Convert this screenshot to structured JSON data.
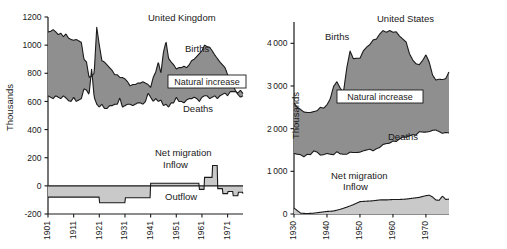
{
  "figure": {
    "background": "#ffffff",
    "ink": "#1a1a1a",
    "fill_dark": "#8f8f8f",
    "fill_light": "#c9c9c9"
  },
  "chart_data": [
    {
      "type": "area",
      "id": "united-kingdom",
      "title": "United Kingdom",
      "xlabel": "",
      "ylabel": "Thousands",
      "grid": false,
      "legend_position": "inline-annotations",
      "xlim": [
        1901,
        1977
      ],
      "ylim": [
        -200,
        1200
      ],
      "yticks": [
        -200,
        0,
        200,
        400,
        600,
        800,
        1000,
        1200
      ],
      "xticks": [
        1901,
        1911,
        1921,
        1931,
        1941,
        1951,
        1961,
        1971
      ],
      "annotations": [
        {
          "text": "United Kingdom",
          "kind": "panel-title"
        },
        {
          "text": "Births",
          "kind": "series"
        },
        {
          "text": "Deaths",
          "kind": "series"
        },
        {
          "text": "Natural increase",
          "kind": "boxed-band"
        },
        {
          "text": "Net migration",
          "kind": "series"
        },
        {
          "text": "Inflow",
          "kind": "series"
        },
        {
          "text": "Outflow",
          "kind": "series"
        }
      ],
      "series": [
        {
          "name": "Births",
          "x": [
            1901,
            1902,
            1903,
            1904,
            1905,
            1906,
            1907,
            1908,
            1909,
            1910,
            1911,
            1912,
            1913,
            1914,
            1915,
            1916,
            1917,
            1918,
            1919,
            1920,
            1921,
            1922,
            1923,
            1924,
            1925,
            1926,
            1927,
            1928,
            1929,
            1930,
            1931,
            1932,
            1933,
            1934,
            1935,
            1936,
            1937,
            1938,
            1939,
            1940,
            1941,
            1942,
            1943,
            1944,
            1945,
            1946,
            1947,
            1948,
            1949,
            1950,
            1951,
            1952,
            1953,
            1954,
            1955,
            1956,
            1957,
            1958,
            1959,
            1960,
            1961,
            1962,
            1963,
            1964,
            1965,
            1966,
            1967,
            1968,
            1969,
            1970,
            1971,
            1972,
            1973,
            1974,
            1975,
            1976,
            1977
          ],
          "values": [
            1093,
            1098,
            1110,
            1095,
            1075,
            1085,
            1060,
            1080,
            1050,
            1040,
            1035,
            1040,
            1030,
            1020,
            900,
            880,
            770,
            780,
            800,
            1127,
            1000,
            890,
            880,
            860,
            840,
            820,
            790,
            790,
            770,
            770,
            760,
            740,
            710,
            720,
            720,
            730,
            730,
            740,
            730,
            720,
            700,
            770,
            810,
            880,
            800,
            950,
            1025,
            905,
            880,
            860,
            830,
            840,
            840,
            850,
            840,
            860,
            890,
            900,
            920,
            940,
            960,
            1000,
            990,
            985,
            960,
            930,
            905,
            880,
            860,
            840,
            790,
            760,
            720,
            680,
            650,
            630,
            640
          ]
        },
        {
          "name": "Deaths",
          "x": [
            1901,
            1902,
            1903,
            1904,
            1905,
            1906,
            1907,
            1908,
            1909,
            1910,
            1911,
            1912,
            1913,
            1914,
            1915,
            1916,
            1917,
            1918,
            1919,
            1920,
            1921,
            1922,
            1923,
            1924,
            1925,
            1926,
            1927,
            1928,
            1929,
            1930,
            1931,
            1932,
            1933,
            1934,
            1935,
            1936,
            1937,
            1938,
            1939,
            1940,
            1941,
            1942,
            1943,
            1944,
            1945,
            1946,
            1947,
            1948,
            1949,
            1950,
            1951,
            1952,
            1953,
            1954,
            1955,
            1956,
            1957,
            1958,
            1959,
            1960,
            1961,
            1962,
            1963,
            1964,
            1965,
            1966,
            1967,
            1968,
            1969,
            1970,
            1971,
            1972,
            1973,
            1974,
            1975,
            1976,
            1977
          ],
          "values": [
            640,
            630,
            620,
            640,
            630,
            620,
            640,
            625,
            605,
            600,
            630,
            600,
            610,
            620,
            690,
            680,
            650,
            830,
            630,
            580,
            560,
            580,
            550,
            550,
            570,
            570,
            580,
            580,
            625,
            560,
            570,
            580,
            580,
            570,
            580,
            590,
            590,
            580,
            600,
            660,
            630,
            600,
            620,
            600,
            610,
            570,
            580,
            560,
            590,
            590,
            630,
            600,
            600,
            590,
            610,
            620,
            620,
            630,
            620,
            600,
            630,
            640,
            640,
            620,
            630,
            640,
            620,
            640,
            650,
            660,
            640,
            670,
            670,
            670,
            660,
            680,
            655
          ]
        },
        {
          "name": "Net migration",
          "x": [
            1901,
            1911,
            1921,
            1925,
            1931,
            1936,
            1941,
            1946,
            1951,
            1956,
            1960,
            1961,
            1962,
            1963,
            1965,
            1967,
            1969,
            1971,
            1973,
            1975,
            1977
          ],
          "values": [
            -80,
            -80,
            -120,
            -120,
            -85,
            -85,
            18,
            18,
            18,
            18,
            -25,
            -25,
            60,
            60,
            145,
            -20,
            -55,
            -40,
            -70,
            -45,
            -55
          ]
        }
      ]
    },
    {
      "type": "area",
      "id": "united-states",
      "title": "United States",
      "xlabel": "",
      "ylabel": "Thousands",
      "grid": false,
      "legend_position": "inline-annotations",
      "xlim": [
        1930,
        1977
      ],
      "ylim": [
        0,
        4500
      ],
      "yticks": [
        0,
        1000,
        2000,
        3000,
        4000
      ],
      "xticks": [
        1930,
        1940,
        1950,
        1960,
        1970
      ],
      "annotations": [
        {
          "text": "United States",
          "kind": "panel-title"
        },
        {
          "text": "Births",
          "kind": "series"
        },
        {
          "text": "Deaths",
          "kind": "series"
        },
        {
          "text": "Natural increase",
          "kind": "boxed-band"
        },
        {
          "text": "Net migration",
          "kind": "series"
        },
        {
          "text": "Inflow",
          "kind": "series"
        }
      ],
      "series": [
        {
          "name": "Births",
          "x": [
            1930,
            1931,
            1932,
            1933,
            1934,
            1935,
            1936,
            1937,
            1938,
            1939,
            1940,
            1941,
            1942,
            1943,
            1944,
            1945,
            1946,
            1947,
            1948,
            1949,
            1950,
            1951,
            1952,
            1953,
            1954,
            1955,
            1956,
            1957,
            1958,
            1959,
            1960,
            1961,
            1962,
            1963,
            1964,
            1965,
            1966,
            1967,
            1968,
            1969,
            1970,
            1971,
            1972,
            1973,
            1974,
            1975,
            1976,
            1977
          ],
          "values": [
            2600,
            2500,
            2450,
            2390,
            2380,
            2380,
            2400,
            2420,
            2500,
            2480,
            2560,
            2700,
            2990,
            3100,
            2950,
            2860,
            3420,
            3820,
            3640,
            3650,
            3650,
            3820,
            3910,
            3970,
            4080,
            4100,
            4220,
            4300,
            4260,
            4300,
            4260,
            4270,
            4170,
            4100,
            4030,
            3760,
            3610,
            3520,
            3500,
            3600,
            3730,
            3560,
            3260,
            3140,
            3160,
            3150,
            3170,
            3330
          ]
        },
        {
          "name": "Deaths",
          "x": [
            1930,
            1931,
            1932,
            1933,
            1934,
            1935,
            1936,
            1937,
            1938,
            1939,
            1940,
            1941,
            1942,
            1943,
            1944,
            1945,
            1946,
            1947,
            1948,
            1949,
            1950,
            1951,
            1952,
            1953,
            1954,
            1955,
            1956,
            1957,
            1958,
            1959,
            1960,
            1961,
            1962,
            1963,
            1964,
            1965,
            1966,
            1967,
            1968,
            1969,
            1970,
            1971,
            1972,
            1973,
            1974,
            1975,
            1976,
            1977
          ],
          "values": [
            1420,
            1400,
            1390,
            1340,
            1400,
            1390,
            1480,
            1450,
            1380,
            1390,
            1420,
            1400,
            1390,
            1460,
            1410,
            1400,
            1400,
            1450,
            1440,
            1440,
            1450,
            1480,
            1500,
            1520,
            1480,
            1530,
            1560,
            1630,
            1650,
            1660,
            1710,
            1700,
            1760,
            1810,
            1800,
            1830,
            1860,
            1850,
            1930,
            1920,
            1920,
            1930,
            1960,
            1970,
            1930,
            1890,
            1910,
            1900
          ]
        },
        {
          "name": "Net migration",
          "x": [
            1930,
            1932,
            1934,
            1936,
            1938,
            1940,
            1942,
            1944,
            1946,
            1948,
            1950,
            1952,
            1954,
            1956,
            1958,
            1960,
            1962,
            1964,
            1966,
            1968,
            1970,
            1971,
            1972,
            1973,
            1974,
            1975,
            1976,
            1977
          ],
          "values": [
            140,
            20,
            10,
            20,
            40,
            60,
            70,
            110,
            160,
            220,
            290,
            300,
            310,
            330,
            330,
            340,
            340,
            350,
            370,
            390,
            430,
            440,
            400,
            330,
            320,
            420,
            340,
            350
          ]
        }
      ]
    }
  ]
}
